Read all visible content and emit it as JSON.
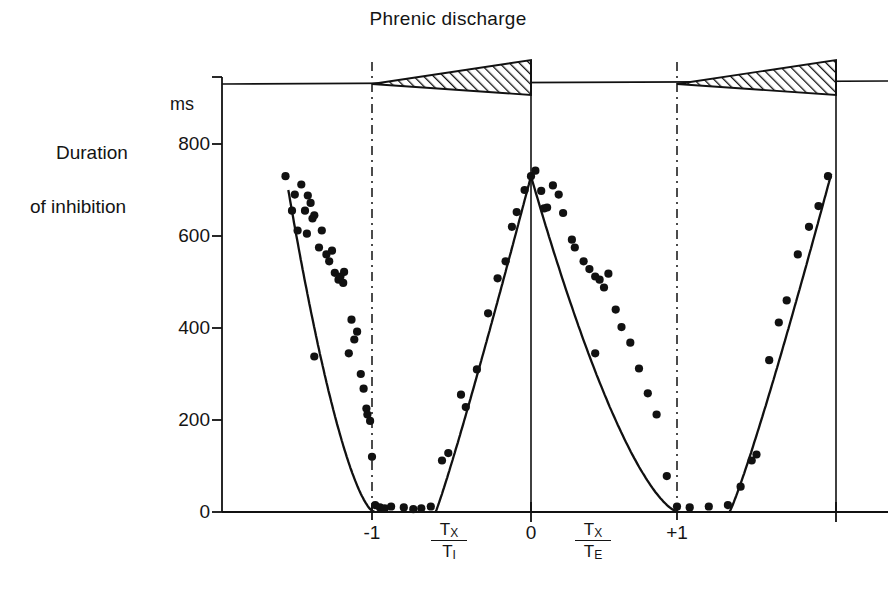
{
  "chart_data": {
    "type": "scatter",
    "title": "Phrenic discharge",
    "ylabel_line1": "Duration",
    "ylabel_line2": "of inhibition",
    "yunit": "ms",
    "ylim": [
      0,
      900
    ],
    "yticks": [
      0,
      200,
      400,
      600,
      800
    ],
    "ytick_labels": [
      "0",
      "200",
      "400",
      "600",
      "800"
    ],
    "xlim": [
      -2.0,
      2.0
    ],
    "xticks": [
      -1,
      0,
      1
    ],
    "xtick_labels": [
      "-1",
      "0",
      "+1"
    ],
    "xaxis_fraction_left_num": "T",
    "xaxis_fraction_left_num_sub": "X",
    "xaxis_fraction_left_den": "T",
    "xaxis_fraction_left_den_sub": "I",
    "xaxis_fraction_right_num": "T",
    "xaxis_fraction_right_num_sub": "X",
    "xaxis_fraction_right_den": "T",
    "xaxis_fraction_right_den_sub": "E",
    "grid": false,
    "legend": false,
    "marker": "filled-circle",
    "marker_color": "#111111",
    "curve_color": "#111111",
    "series": [
      {
        "name": "inspiratory-phase-left",
        "points": [
          [
            -1.93,
            730
          ],
          [
            -1.86,
            655
          ],
          [
            -1.83,
            690
          ],
          [
            -1.8,
            612
          ],
          [
            -1.76,
            712
          ],
          [
            -1.72,
            655
          ],
          [
            -1.7,
            605
          ],
          [
            -1.69,
            688
          ],
          [
            -1.66,
            672
          ],
          [
            -1.64,
            638
          ],
          [
            -1.62,
            645
          ],
          [
            -1.57,
            575
          ],
          [
            -1.54,
            612
          ],
          [
            -1.49,
            560
          ],
          [
            -1.46,
            545
          ],
          [
            -1.43,
            568
          ],
          [
            -1.4,
            520
          ],
          [
            -1.36,
            505
          ],
          [
            -1.34,
            512
          ],
          [
            -1.31,
            498
          ],
          [
            -1.3,
            522
          ],
          [
            -1.25,
            345
          ],
          [
            -1.22,
            418
          ],
          [
            -1.19,
            375
          ],
          [
            -1.16,
            392
          ],
          [
            -1.12,
            300
          ],
          [
            -1.09,
            268
          ],
          [
            -1.06,
            225
          ],
          [
            -1.05,
            212
          ],
          [
            -1.02,
            198
          ],
          [
            -1.0,
            120
          ],
          [
            -0.98,
            15
          ],
          [
            -0.95,
            10
          ],
          [
            -1.62,
            338
          ]
        ],
        "curve": "decreasing-parabolic"
      },
      {
        "name": "expiratory-phase-middle",
        "points": [
          [
            -0.92,
            8
          ],
          [
            -0.88,
            12
          ],
          [
            -0.8,
            10
          ],
          [
            -0.74,
            6
          ],
          [
            -0.69,
            8
          ],
          [
            -0.63,
            12
          ],
          [
            -0.56,
            112
          ],
          [
            -0.52,
            128
          ],
          [
            -0.44,
            255
          ],
          [
            -0.41,
            228
          ],
          [
            -0.34,
            310
          ],
          [
            -0.27,
            432
          ],
          [
            -0.21,
            508
          ],
          [
            -0.16,
            545
          ],
          [
            -0.12,
            620
          ],
          [
            -0.09,
            652
          ],
          [
            -0.04,
            700
          ],
          [
            0.0,
            730
          ],
          [
            0.03,
            742
          ],
          [
            0.07,
            698
          ],
          [
            0.09,
            660
          ],
          [
            0.11,
            662
          ],
          [
            0.15,
            710
          ],
          [
            0.19,
            690
          ],
          [
            0.22,
            650
          ],
          [
            0.28,
            592
          ],
          [
            0.3,
            575
          ],
          [
            0.36,
            545
          ],
          [
            0.4,
            528
          ],
          [
            0.44,
            512
          ],
          [
            0.47,
            505
          ],
          [
            0.5,
            488
          ],
          [
            0.53,
            518
          ],
          [
            0.44,
            345
          ],
          [
            0.58,
            440
          ],
          [
            0.62,
            402
          ],
          [
            0.68,
            368
          ],
          [
            0.74,
            312
          ],
          [
            0.8,
            258
          ],
          [
            0.86,
            212
          ],
          [
            0.93,
            78
          ],
          [
            1.0,
            12
          ]
        ],
        "curve": "peak-at-zero"
      },
      {
        "name": "inspiratory-phase-right",
        "points": [
          [
            1.08,
            10
          ],
          [
            1.2,
            12
          ],
          [
            1.32,
            15
          ],
          [
            1.4,
            55
          ],
          [
            1.47,
            112
          ],
          [
            1.5,
            125
          ],
          [
            1.58,
            330
          ],
          [
            1.64,
            412
          ],
          [
            1.69,
            460
          ],
          [
            1.76,
            560
          ],
          [
            1.83,
            620
          ],
          [
            1.89,
            665
          ],
          [
            1.95,
            730
          ]
        ],
        "curve": "increasing-parabolic"
      }
    ],
    "phrenic_bursts": [
      {
        "start": -1.0,
        "end": 0.0,
        "shape": "ramp",
        "fill": "diagonal-hatch"
      },
      {
        "start": 1.0,
        "end": 2.0,
        "shape": "ramp",
        "fill": "diagonal-hatch"
      }
    ]
  },
  "axes": {
    "vertical_markers": [
      {
        "x": -1,
        "style": "dash-dot"
      },
      {
        "x": 0,
        "style": "solid"
      },
      {
        "x": 1,
        "style": "dash-dot"
      },
      {
        "x": 2,
        "style": "solid"
      }
    ]
  }
}
